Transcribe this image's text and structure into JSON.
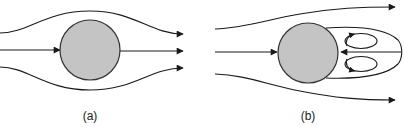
{
  "figure": {
    "colors": {
      "background": "#ffffff",
      "stroke": "#1a1a1a",
      "cylinder_fill": "#c4c4c4",
      "cylinder_stroke": "#333333"
    },
    "panels": [
      {
        "id": "a",
        "label": "(a)",
        "cylinder": {
          "cx": 90,
          "cy": 50,
          "r": 30
        },
        "streamlines": [
          "upper curved streamline",
          "centerline streamline",
          "lower curved streamline"
        ],
        "arrowheads": 4
      },
      {
        "id": "b",
        "label": "(b)",
        "cylinder": {
          "cx": 308,
          "cy": 53,
          "r": 30
        },
        "streamlines": [
          "upper diverging streamline",
          "centerline streamline",
          "lower diverging streamline"
        ],
        "wake": {
          "shape": "closed elongated separation bubble",
          "tip_x": 400
        },
        "recirculation_eddies": 2,
        "reverse_flow_arrow": true,
        "arrowheads": 6
      }
    ]
  }
}
